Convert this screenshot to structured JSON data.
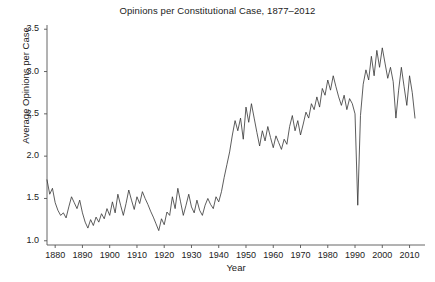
{
  "chart_data": {
    "type": "line",
    "title": "Opinions per Constitutional Case, 1877–2012",
    "xlabel": "Year",
    "ylabel": "Average Opinions per Case",
    "grid": false,
    "legend": false,
    "xlim": [
      1877,
      2012
    ],
    "ylim": [
      0.95,
      3.55
    ],
    "xticks": [
      1880,
      1890,
      1900,
      1910,
      1920,
      1930,
      1940,
      1950,
      1960,
      1970,
      1980,
      1990,
      2000,
      2010
    ],
    "xtick_labels": [
      "1880",
      "1890",
      "1900",
      "1910",
      "1920",
      "1930",
      "1940",
      "1950",
      "1960",
      "1970",
      "1980",
      "1990",
      "2000",
      "2010"
    ],
    "yticks": [
      1.0,
      1.5,
      2.0,
      2.5,
      3.0,
      3.5
    ],
    "ytick_labels": [
      "1.0",
      "1.5",
      "2.0",
      "2.5",
      "3.0",
      "3.5"
    ],
    "line_color": "#333333",
    "line_width": 0.8,
    "x": [
      1877,
      1878,
      1879,
      1880,
      1881,
      1882,
      1883,
      1884,
      1885,
      1886,
      1887,
      1888,
      1889,
      1890,
      1891,
      1892,
      1893,
      1894,
      1895,
      1896,
      1897,
      1898,
      1899,
      1900,
      1901,
      1902,
      1903,
      1904,
      1905,
      1906,
      1907,
      1908,
      1909,
      1910,
      1911,
      1912,
      1913,
      1914,
      1915,
      1916,
      1917,
      1918,
      1919,
      1920,
      1921,
      1922,
      1923,
      1924,
      1925,
      1926,
      1927,
      1928,
      1929,
      1930,
      1931,
      1932,
      1933,
      1934,
      1935,
      1936,
      1937,
      1938,
      1939,
      1940,
      1941,
      1942,
      1943,
      1944,
      1945,
      1946,
      1947,
      1948,
      1949,
      1950,
      1951,
      1952,
      1953,
      1954,
      1955,
      1956,
      1957,
      1958,
      1959,
      1960,
      1961,
      1962,
      1963,
      1964,
      1965,
      1966,
      1967,
      1968,
      1969,
      1970,
      1971,
      1972,
      1973,
      1974,
      1975,
      1976,
      1977,
      1978,
      1979,
      1980,
      1981,
      1982,
      1983,
      1984,
      1985,
      1986,
      1987,
      1988,
      1989,
      1990,
      1991,
      1992,
      1993,
      1994,
      1995,
      1996,
      1997,
      1998,
      1999,
      2000,
      2001,
      2002,
      2003,
      2004,
      2005,
      2006,
      2007,
      2008,
      2009,
      2010,
      2011,
      2012
    ],
    "values": [
      1.72,
      1.55,
      1.62,
      1.45,
      1.36,
      1.3,
      1.33,
      1.27,
      1.4,
      1.52,
      1.45,
      1.38,
      1.48,
      1.33,
      1.22,
      1.15,
      1.25,
      1.18,
      1.28,
      1.22,
      1.32,
      1.26,
      1.38,
      1.3,
      1.46,
      1.33,
      1.55,
      1.42,
      1.3,
      1.44,
      1.6,
      1.48,
      1.37,
      1.52,
      1.44,
      1.58,
      1.5,
      1.43,
      1.35,
      1.28,
      1.2,
      1.12,
      1.26,
      1.19,
      1.34,
      1.3,
      1.52,
      1.38,
      1.62,
      1.46,
      1.3,
      1.42,
      1.55,
      1.4,
      1.33,
      1.48,
      1.36,
      1.3,
      1.42,
      1.5,
      1.43,
      1.38,
      1.52,
      1.46,
      1.58,
      1.75,
      1.9,
      2.05,
      2.25,
      2.42,
      2.3,
      2.45,
      2.2,
      2.58,
      2.4,
      2.62,
      2.45,
      2.28,
      2.12,
      2.3,
      2.18,
      2.35,
      2.22,
      2.1,
      2.24,
      2.16,
      2.08,
      2.2,
      2.14,
      2.35,
      2.48,
      2.3,
      2.42,
      2.25,
      2.38,
      2.52,
      2.45,
      2.62,
      2.55,
      2.7,
      2.58,
      2.8,
      2.72,
      2.9,
      2.78,
      2.95,
      2.82,
      2.7,
      2.6,
      2.72,
      2.55,
      2.68,
      2.62,
      2.5,
      1.42,
      2.48,
      2.85,
      3.02,
      2.9,
      3.18,
      2.95,
      3.25,
      3.05,
      3.28,
      3.1,
      2.92,
      3.05,
      2.88,
      2.45,
      2.78,
      3.05,
      2.82,
      2.6,
      2.95,
      2.75,
      2.45
    ]
  }
}
